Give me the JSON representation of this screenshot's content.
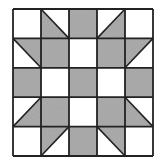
{
  "diagram": {
    "type": "quilt-block",
    "rows": 5,
    "cols": 5,
    "colors": {
      "fill": "#a2a2a2",
      "background": "#ffffff",
      "line": "#222222"
    },
    "grid": {
      "x0": 13,
      "y0": 9,
      "cell_w": 28,
      "cell_h": 29.4
    },
    "legend": {
      "W": "white square",
      "G": "gray square",
      "T-LL": "triangle, gray lower-left (diagonal top-left to bottom-right)",
      "T-UR": "triangle, gray upper-right (diagonal top-left to bottom-right)",
      "T-LR": "triangle, gray lower-right (diagonal top-right to bottom-left)",
      "T-UL": "triangle, gray upper-left (diagonal top-right to bottom-left)"
    },
    "cells": [
      [
        "W",
        "T-LL",
        "G",
        "T-LR",
        "W"
      ],
      [
        "T-UR",
        "G",
        "W",
        "G",
        "T-UL"
      ],
      [
        "G",
        "W",
        "G",
        "W",
        "G"
      ],
      [
        "T-LR",
        "G",
        "W",
        "G",
        "T-LL"
      ],
      [
        "W",
        "T-UL",
        "G",
        "T-UR",
        "W"
      ]
    ]
  }
}
